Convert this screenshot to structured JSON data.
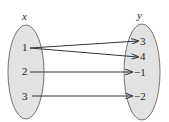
{
  "diagram": {
    "type": "mapping-diagram",
    "domain_set": {
      "label": "x",
      "elements": [
        "1",
        "2",
        "3"
      ]
    },
    "range_set": {
      "label": "y",
      "elements": [
        "3",
        "4",
        "−1",
        "−2"
      ]
    },
    "mappings": [
      {
        "from": "1",
        "to": "3"
      },
      {
        "from": "1",
        "to": "4"
      },
      {
        "from": "2",
        "to": "−1"
      },
      {
        "from": "3",
        "to": "−2"
      }
    ],
    "colors": {
      "ellipse_fill": "#e2e2e2",
      "stroke": "#333333"
    }
  }
}
